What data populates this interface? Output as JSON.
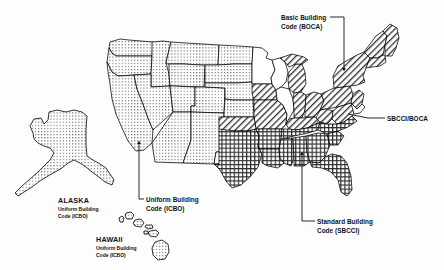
{
  "figure": {
    "background_color": "#fdfdfd",
    "line_color": "#000000"
  },
  "callouts": [
    {
      "id": "boca",
      "line1": "Basic Building",
      "line2": "Code (BOCA)",
      "points_to": "New York / Northeast",
      "pattern": "diagonal-hatch"
    },
    {
      "id": "sbcci-boca",
      "line1": "SBCCI/BOCA",
      "line2": "",
      "points_to": "Virginia / Mid-Atlantic",
      "pattern": "mixed"
    },
    {
      "id": "sbcci",
      "line1": "Standard Building",
      "line2": "Code (SBCCI)",
      "points_to": "Alabama / Southeast",
      "pattern": "cross-hatch"
    },
    {
      "id": "icbo",
      "line1": "Uniform Building",
      "line2": "Code (ICBO)",
      "points_to": "California / West",
      "pattern": "dotted"
    }
  ],
  "insets": [
    {
      "id": "alaska",
      "name": "ALASKA",
      "line1": "Uniform Building",
      "line2": "Code (ICBO)",
      "pattern": "dotted"
    },
    {
      "id": "hawaii",
      "name": "HAWAII",
      "line1": "Uniform Building",
      "line2": "Code (ICBO)",
      "pattern": "dotted"
    }
  ],
  "legend_patterns": {
    "dotted": "Uniform Building Code (ICBO)",
    "diagonal_hatch": "Basic Building Code (BOCA)",
    "cross_hatch": "Standard Building Code (SBCCI)",
    "blank": "No statewide model code"
  }
}
